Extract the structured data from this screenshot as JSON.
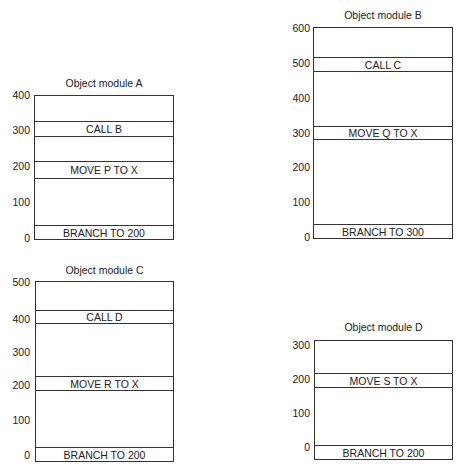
{
  "modules": [
    {
      "id": "A",
      "title": "Object module A",
      "ticks": [
        "400",
        "300",
        "200",
        "100",
        "0"
      ],
      "instructions": [
        "CALL B",
        "MOVE P TO X",
        "BRANCH TO 200"
      ]
    },
    {
      "id": "B",
      "title": "Object module B",
      "ticks": [
        "600",
        "500",
        "400",
        "300",
        "200",
        "100",
        "0"
      ],
      "instructions": [
        "CALL C",
        "MOVE Q TO X",
        "BRANCH TO 300"
      ]
    },
    {
      "id": "C",
      "title": "Object module C",
      "ticks": [
        "500",
        "400",
        "300",
        "200",
        "100",
        "0"
      ],
      "instructions": [
        "CALL D",
        "MOVE R TO X",
        "BRANCH TO 200"
      ]
    },
    {
      "id": "D",
      "title": "Object module D",
      "ticks": [
        "300",
        "200",
        "100",
        "0"
      ],
      "instructions": [
        "MOVE S TO X",
        "BRANCH TO 200"
      ]
    }
  ]
}
